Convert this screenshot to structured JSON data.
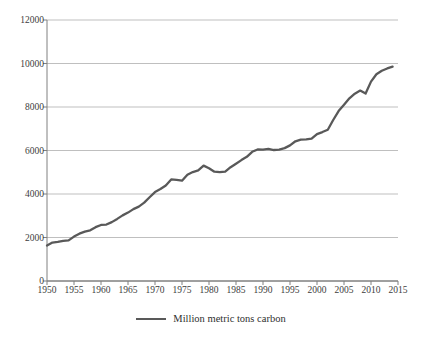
{
  "chart_data": {
    "type": "line",
    "title": "",
    "xlabel": "",
    "ylabel": "",
    "xlim": [
      1950,
      2015
    ],
    "ylim": [
      0,
      12000
    ],
    "grid": true,
    "legend_position": "bottom-center",
    "y_ticks": [
      0,
      2000,
      4000,
      6000,
      8000,
      10000,
      12000
    ],
    "y_tick_labels": [
      "0",
      "2000",
      "4000",
      "6000",
      "8000",
      "10000",
      "12000"
    ],
    "x_ticks": [
      1950,
      1955,
      1960,
      1965,
      1970,
      1975,
      1980,
      1985,
      1990,
      1995,
      2000,
      2005,
      2010,
      2015
    ],
    "x_tick_labels": [
      "1950",
      "1955",
      "1960",
      "1965",
      "1970",
      "1975",
      "1980",
      "1985",
      "1990",
      "1995",
      "2000",
      "2005",
      "2010",
      "2015"
    ],
    "series": [
      {
        "name": "Million metric tons carbon",
        "color": "#595959",
        "x": [
          1950,
          1951,
          1952,
          1953,
          1954,
          1955,
          1956,
          1957,
          1958,
          1959,
          1960,
          1961,
          1962,
          1963,
          1964,
          1965,
          1966,
          1967,
          1968,
          1969,
          1970,
          1971,
          1972,
          1973,
          1974,
          1975,
          1976,
          1977,
          1978,
          1979,
          1980,
          1981,
          1982,
          1983,
          1984,
          1985,
          1986,
          1987,
          1988,
          1989,
          1990,
          1991,
          1992,
          1993,
          1994,
          1995,
          1996,
          1997,
          1998,
          1999,
          2000,
          2001,
          2002,
          2003,
          2004,
          2005,
          2006,
          2007,
          2008,
          2009,
          2010,
          2011,
          2012,
          2013,
          2014
        ],
        "values": [
          1630,
          1767,
          1795,
          1841,
          1865,
          2043,
          2177,
          2270,
          2330,
          2476,
          2577,
          2595,
          2707,
          2855,
          3017,
          3145,
          3306,
          3421,
          3601,
          3851,
          4089,
          4227,
          4394,
          4669,
          4645,
          4612,
          4887,
          5010,
          5085,
          5305,
          5186,
          5025,
          5003,
          5028,
          5232,
          5394,
          5559,
          5708,
          5940,
          6045,
          6041,
          6074,
          6022,
          6044,
          6109,
          6235,
          6424,
          6502,
          6510,
          6543,
          6753,
          6848,
          6955,
          7402,
          7813,
          8104,
          8400,
          8614,
          8756,
          8617,
          9167,
          9508,
          9669,
          9773,
          9855
        ]
      }
    ]
  },
  "legend": {
    "label": "Million metric tons carbon"
  }
}
